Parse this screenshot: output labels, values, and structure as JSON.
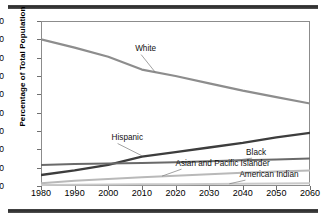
{
  "chart_data": {
    "type": "line",
    "title": "",
    "xlabel": "",
    "ylabel": "Percentage of Total Population",
    "xlim": [
      1980,
      2060
    ],
    "ylim": [
      0,
      90
    ],
    "ytick_step": 10,
    "xtick_step": 10,
    "grid": false,
    "legend": "inline-labels-with-leader-lines",
    "categories": [
      1980,
      1990,
      2000,
      2010,
      2020,
      2030,
      2040,
      2050,
      2060
    ],
    "xticks": [
      "1980",
      "1990",
      "2000",
      "2010",
      "2020",
      "2030",
      "2040",
      "2050",
      "2060"
    ],
    "yticks": [
      "0",
      "10",
      "20",
      "30",
      "40",
      "50",
      "60",
      "70",
      "80",
      "90"
    ],
    "series": [
      {
        "name": "White",
        "label": "White",
        "color": "#8d8d8d",
        "width": 2.2,
        "x": [
          1980,
          1990,
          2000,
          2010,
          2020,
          2030,
          2040,
          2050,
          2060
        ],
        "values": [
          80.0,
          75.5,
          70.5,
          63.5,
          60.0,
          56.0,
          52.0,
          48.5,
          45.0
        ]
      },
      {
        "name": "Hispanic",
        "label": "Hispanic",
        "color": "#3d3d3d",
        "width": 2.4,
        "x": [
          1980,
          1990,
          2000,
          2010,
          2020,
          2030,
          2040,
          2050,
          2060
        ],
        "values": [
          6.0,
          8.5,
          11.5,
          16.0,
          18.5,
          21.0,
          23.5,
          26.5,
          29.0
        ]
      },
      {
        "name": "Black",
        "label": "Black",
        "color": "#6a6a6a",
        "width": 2.0,
        "x": [
          1980,
          1990,
          2000,
          2010,
          2020,
          2030,
          2040,
          2050,
          2060
        ],
        "values": [
          11.5,
          12.0,
          12.3,
          12.6,
          13.0,
          13.5,
          14.0,
          14.5,
          15.0
        ]
      },
      {
        "name": "Asian and Pacific Islander",
        "label": "Asian and Pacific Islander",
        "color": "#b9b9b9",
        "width": 2.0,
        "x": [
          1980,
          1990,
          2000,
          2010,
          2020,
          2030,
          2040,
          2050,
          2060
        ],
        "values": [
          1.5,
          2.8,
          3.8,
          4.8,
          5.6,
          6.4,
          7.2,
          7.9,
          8.5
        ]
      },
      {
        "name": "American Indian",
        "label": "American Indian",
        "color": "#c9c9c9",
        "width": 2.0,
        "x": [
          1980,
          1990,
          2000,
          2010,
          2020,
          2030,
          2040,
          2050,
          2060
        ],
        "values": [
          0.6,
          0.7,
          0.8,
          0.9,
          1.0,
          1.1,
          1.2,
          1.35,
          1.5
        ]
      }
    ],
    "annotations": [
      {
        "name": "White",
        "label_x": 2008,
        "label_y": 72.5,
        "anchor_x": 2014,
        "anchor_y": 62.0
      },
      {
        "name": "Hispanic",
        "label_x": 2001,
        "label_y": 24.0,
        "anchor_x": 2010,
        "anchor_y": 16.5
      },
      {
        "name": "Black",
        "label_x": 2041,
        "label_y": 16.0,
        "anchor_x": 2036,
        "anchor_y": 13.6
      },
      {
        "name": "Asian and Pacific Islander",
        "label_x": 2020,
        "label_y": 10.0,
        "anchor_x": 2016,
        "anchor_y": 5.4
      },
      {
        "name": "American Indian",
        "label_x": 2039,
        "label_y": 4.0,
        "anchor_x": 2036,
        "anchor_y": 1.2
      }
    ]
  }
}
